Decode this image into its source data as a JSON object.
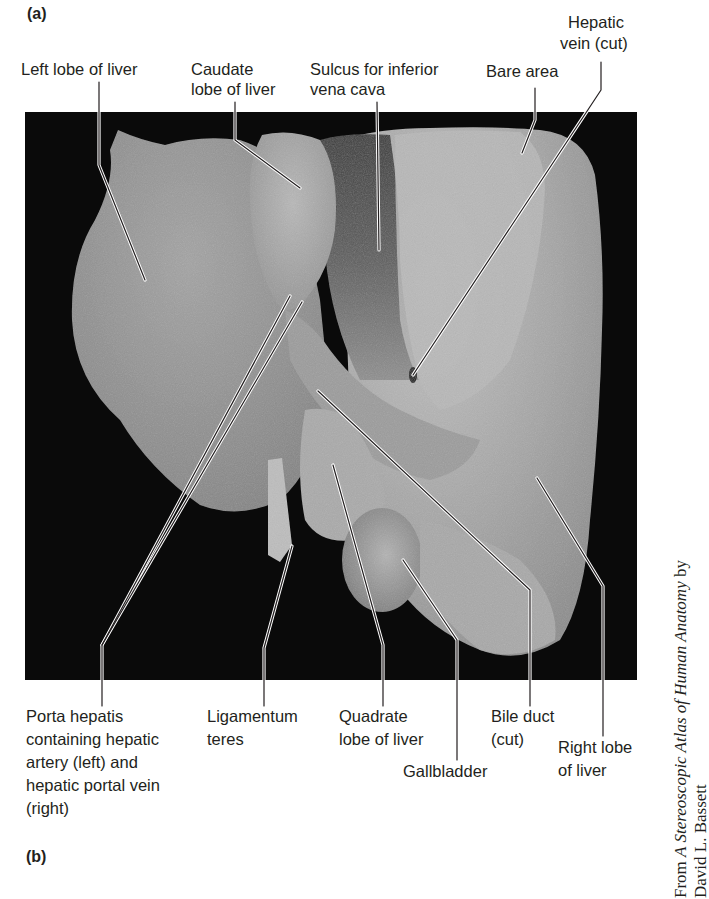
{
  "figure": {
    "panel_a": "(a)",
    "panel_b": "(b)",
    "background_color": "#000000",
    "leader_color": "#231f20"
  },
  "labels_top": {
    "left_lobe": "Left lobe of liver",
    "caudate_1": "Caudate",
    "caudate_2": "lobe of liver",
    "sulcus_1": "Sulcus for inferior",
    "sulcus_2": "vena cava",
    "bare_area": "Bare area",
    "hepatic_vein_1": "Hepatic",
    "hepatic_vein_2": "vein (cut)"
  },
  "labels_bottom": {
    "porta_1": "Porta hepatis",
    "porta_2": "containing hepatic",
    "porta_3": "artery (left) and",
    "porta_4": "hepatic portal vein",
    "porta_5": "(right)",
    "ligamentum_1": "Ligamentum",
    "ligamentum_2": "teres",
    "quadrate_1": "Quadrate",
    "quadrate_2": "lobe of liver",
    "gallbladder": "Gallbladder",
    "bile_duct_1": "Bile duct",
    "bile_duct_2": "(cut)",
    "right_lobe_1": "Right lobe",
    "right_lobe_2": "of liver"
  },
  "credit": {
    "prefix": "From ",
    "title": "A Stereoscopic Atlas of Human Anatomy",
    "suffix": " by",
    "author": "David L. Bassett"
  }
}
